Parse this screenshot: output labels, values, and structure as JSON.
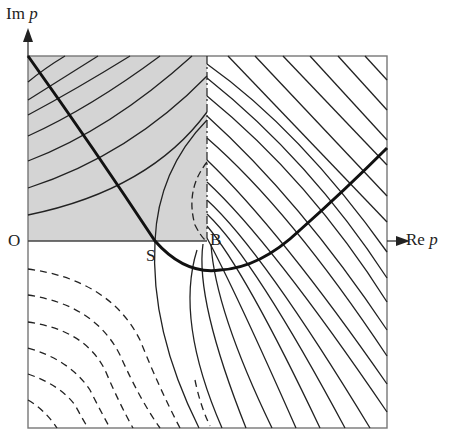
{
  "figure": {
    "type": "complex-plane contour diagram (steepest descent)",
    "axes": {
      "vertical_label_prefix": "Im",
      "vertical_label_var": "p",
      "horizontal_label_prefix": "Re",
      "horizontal_label_var": "p"
    },
    "points": {
      "origin": "O",
      "saddle": "S",
      "branch_point": "B"
    },
    "regions": {
      "shaded_fill": "#d4d4d4",
      "shaded_description": "upper-left quadrant between O and B"
    },
    "colors": {
      "line": "#222222",
      "frame": "#777777",
      "shade": "#d4d4d4",
      "background": "#ffffff"
    },
    "contours": {
      "solid_upper_left_count": 8,
      "solid_right_count": 17,
      "dashed_lower_left_count": 7,
      "branch_cut": "dashed vertical line from B upward"
    }
  }
}
